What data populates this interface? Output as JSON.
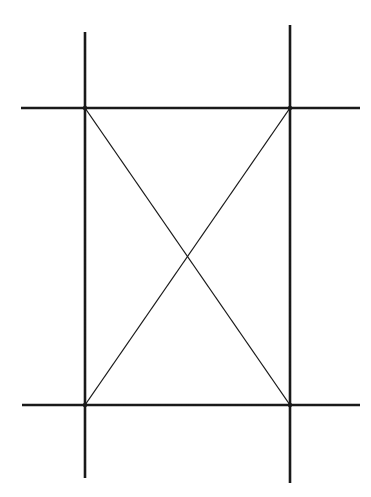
{
  "diagram": {
    "type": "line-drawing",
    "colors": {
      "background": "#ffffff",
      "stroke": "#1a1a1a"
    },
    "thick_lines": [
      {
        "id": "vertical-left",
        "x1": 85,
        "y1": 32,
        "x2": 85,
        "y2": 478
      },
      {
        "id": "vertical-right",
        "x1": 290,
        "y1": 25,
        "x2": 290,
        "y2": 483
      },
      {
        "id": "horizontal-top",
        "x1": 21,
        "y1": 108,
        "x2": 360,
        "y2": 108
      },
      {
        "id": "horizontal-bottom",
        "x1": 22,
        "y1": 405,
        "x2": 360,
        "y2": 405
      }
    ],
    "thin_lines": [
      {
        "id": "diagonal-top-left-to-bottom-right",
        "x1": 85,
        "y1": 108,
        "x2": 290,
        "y2": 405
      },
      {
        "id": "diagonal-top-right-to-bottom-left",
        "x1": 290,
        "y1": 108,
        "x2": 85,
        "y2": 405
      }
    ],
    "vertices": [
      {
        "id": "top-left",
        "x": 85,
        "y": 108
      },
      {
        "id": "top-right",
        "x": 290,
        "y": 108
      },
      {
        "id": "bottom-left",
        "x": 85,
        "y": 405
      },
      {
        "id": "bottom-right",
        "x": 290,
        "y": 405
      },
      {
        "id": "diagonal-intersection",
        "x": 187.5,
        "y": 256.5
      }
    ]
  }
}
